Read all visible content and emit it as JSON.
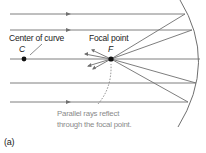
{
  "diagram": {
    "labels": {
      "center_of_curve": "Center of curve",
      "c": "C",
      "focal_point": "Focal point",
      "f": "F",
      "caption_line1": "Parallel rays reflect",
      "caption_line2": "through the focal point.",
      "panel": "(a)"
    },
    "colors": {
      "ray": "#6f6f6f",
      "mirror": "#6f6f6f",
      "point": "#111111",
      "caption": "#8a8a8a"
    },
    "rays_y": [
      14,
      30,
      59,
      83,
      102
    ],
    "center_point": {
      "x": 24,
      "y": 59
    },
    "focal_point": {
      "x": 111,
      "y": 59
    }
  }
}
